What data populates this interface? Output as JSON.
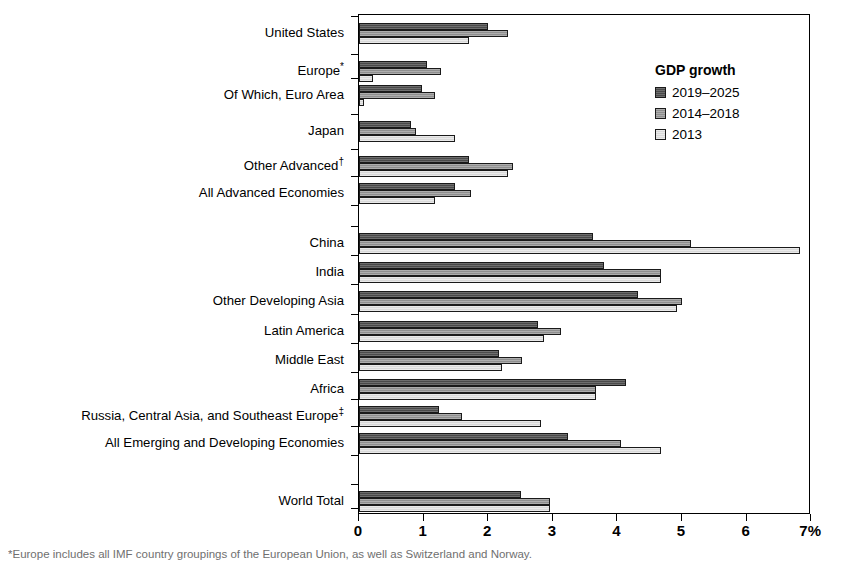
{
  "chart_data": {
    "type": "bar",
    "orientation": "horizontal",
    "title": "",
    "xlabel": "",
    "ylabel": "",
    "xlim": [
      0,
      7
    ],
    "xticks": [
      0,
      1,
      2,
      3,
      4,
      5,
      6,
      7
    ],
    "xtick_labels": [
      "0",
      "1",
      "2",
      "3",
      "4",
      "5",
      "6",
      "7%"
    ],
    "grid": false,
    "legend_title": "GDP growth",
    "legend_position": "upper right inside",
    "categories": [
      "United States",
      "Europe*",
      "Of Which, Euro Area",
      "Japan",
      "Other Advanced†",
      "All Advanced Economies",
      "China",
      "India",
      "Other Developing Asia",
      "Latin America",
      "Middle East",
      "Africa",
      "Russia, Central Asia, and Southeast Europe‡",
      "All Emerging and Developing Economies",
      "World Total"
    ],
    "series": [
      {
        "name": "2019–2025",
        "color": "#4a4a4a",
        "values": [
          2.0,
          1.05,
          0.98,
          0.8,
          1.7,
          1.48,
          3.62,
          3.8,
          4.32,
          2.77,
          2.17,
          4.13,
          1.24,
          3.23,
          2.5
        ]
      },
      {
        "name": "2014–2018",
        "color": "#8e8e8e",
        "values": [
          2.3,
          1.27,
          1.17,
          0.88,
          2.38,
          1.73,
          5.14,
          4.67,
          5.0,
          3.13,
          2.53,
          3.67,
          1.6,
          4.06,
          2.95
        ]
      },
      {
        "name": "2013",
        "color": "#d8d8d8",
        "values": [
          1.71,
          0.21,
          0.08,
          1.48,
          2.3,
          1.17,
          6.82,
          4.67,
          4.93,
          2.87,
          2.22,
          3.67,
          2.82,
          4.67,
          2.95
        ]
      }
    ],
    "group_breaks": [
      "after-All Advanced Economies",
      "after-All Emerging and Developing Economies"
    ]
  },
  "legend": {
    "title": "GDP growth",
    "items": [
      {
        "label": "2019–2025",
        "swatch": "dark"
      },
      {
        "label": "2014–2018",
        "swatch": "medium"
      },
      {
        "label": "2013",
        "swatch": "light"
      }
    ]
  },
  "axis": {
    "x_tick_labels": [
      "0",
      "1",
      "2",
      "3",
      "4",
      "5",
      "6",
      "7%"
    ]
  },
  "labels": {
    "united_states": "United States",
    "europe": "Europe*",
    "euro_area": "Of Which, Euro Area",
    "japan": "Japan",
    "other_advanced": "Other Advanced†",
    "all_advanced": "All Advanced Economies",
    "china": "China",
    "india": "India",
    "other_developing_asia": "Other Developing Asia",
    "latin_america": "Latin America",
    "middle_east": "Middle East",
    "africa": "Africa",
    "russia_ca_se_europe": "Russia, Central Asia, and Southeast Europe‡",
    "all_emerging": "All Emerging and Developing Economies",
    "world_total": "World Total"
  },
  "footnote": {
    "text": "*Europe includes all IMF country groupings of the European Union, as well as Switzerland and Norway."
  }
}
